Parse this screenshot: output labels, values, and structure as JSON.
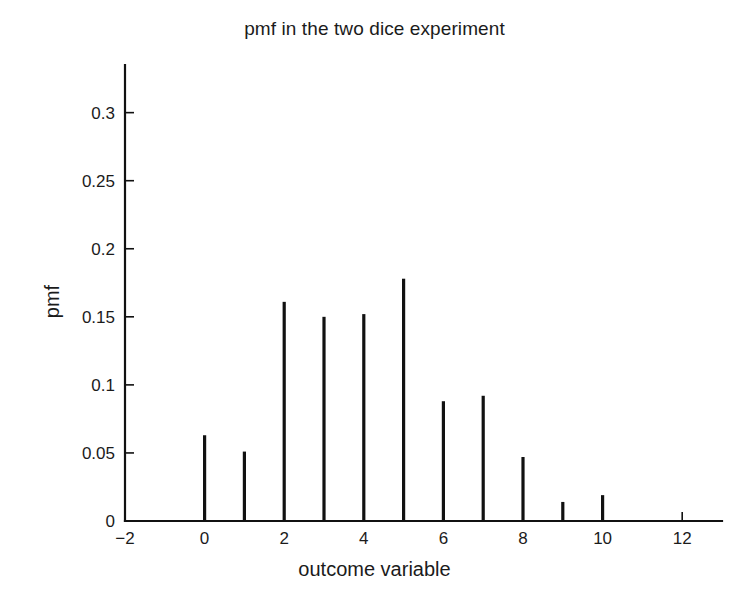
{
  "chart_data": {
    "type": "bar",
    "subtype": "stem",
    "title": "pmf in the two dice experiment",
    "xlabel": "outcome variable",
    "ylabel": "pmf",
    "x": [
      0,
      1,
      2,
      3,
      4,
      5,
      6,
      7,
      8,
      9,
      10
    ],
    "values": [
      0.063,
      0.051,
      0.161,
      0.15,
      0.152,
      0.178,
      0.088,
      0.092,
      0.047,
      0.014,
      0.019
    ],
    "categories": [
      "0",
      "1",
      "2",
      "3",
      "4",
      "5",
      "6",
      "7",
      "8",
      "9",
      "10"
    ],
    "xlim": [
      -2,
      13
    ],
    "ylim": [
      0,
      0.335
    ],
    "xticks": [
      -2,
      0,
      2,
      4,
      6,
      8,
      10,
      12
    ],
    "xticklabels": [
      "−2",
      "0",
      "2",
      "4",
      "6",
      "8",
      "10",
      "12"
    ],
    "yticks": [
      0,
      0.05,
      0.1,
      0.15,
      0.2,
      0.25,
      0.3
    ],
    "yticklabels": [
      "0",
      "0.05",
      "0.1",
      "0.15",
      "0.2",
      "0.25",
      "0.3"
    ],
    "grid": false,
    "legend": null,
    "series_color": "#111111",
    "background_color": "#ffffff"
  }
}
